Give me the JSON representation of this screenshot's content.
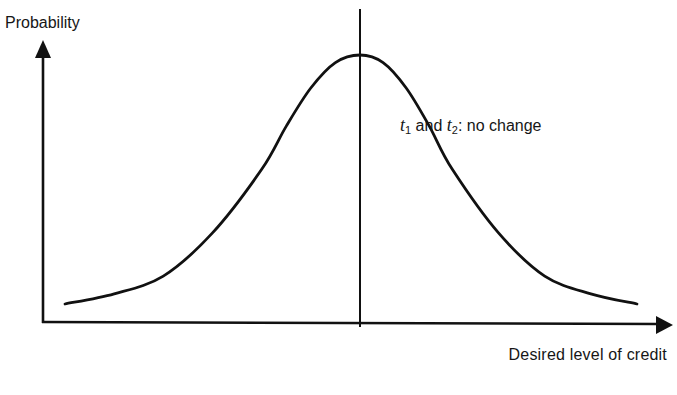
{
  "figure": {
    "y_axis_label": "Probability",
    "x_axis_label": "Desired level of credit",
    "annotation": {
      "t1_var": "t",
      "t1_sub": "1",
      "connector": " and ",
      "t2_var": "t",
      "t2_sub": "2",
      "suffix": ": no change"
    },
    "colors": {
      "background": "#ffffff",
      "ink": "#111111"
    }
  },
  "chart_data": {
    "type": "line",
    "title": "",
    "xlabel": "Desired level of credit",
    "ylabel": "Probability",
    "grid": false,
    "legend": null,
    "annotations": [
      "t1 and t2: no change"
    ],
    "reference_lines": [
      {
        "orientation": "vertical",
        "x": 0,
        "label": ""
      }
    ],
    "axis_ticks": "none",
    "x_range": [
      -3.5,
      3.5
    ],
    "y_range": [
      0,
      1
    ],
    "curve": {
      "shape": "bell",
      "center": 0,
      "x": [
        -3.0,
        -2.5,
        -2.0,
        -1.5,
        -1.0,
        -0.75,
        -0.5,
        -0.25,
        0,
        0.25,
        0.5,
        0.75,
        1.0,
        1.5,
        2.0,
        2.5,
        3.0
      ],
      "y": [
        0.02,
        0.06,
        0.13,
        0.3,
        0.55,
        0.72,
        0.87,
        0.97,
        1.0,
        0.97,
        0.87,
        0.72,
        0.55,
        0.3,
        0.13,
        0.06,
        0.02
      ]
    }
  }
}
